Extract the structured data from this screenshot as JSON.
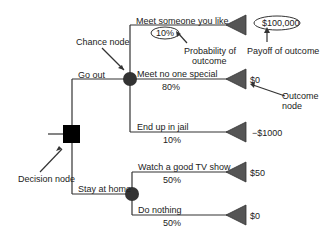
{
  "diagram": {
    "type": "decision-tree",
    "decision_node": {
      "label": "Decision node"
    },
    "branches": [
      {
        "label": "Go out",
        "chance_node_label": "Chance node",
        "outcomes": [
          {
            "label": "Meet someone you like",
            "probability": "10%",
            "payoff": "$100,000"
          },
          {
            "label": "Meet no one special",
            "probability": "80%",
            "payoff": "$0"
          },
          {
            "label": "End up in jail",
            "probability": "10%",
            "payoff": "−$1000"
          }
        ]
      },
      {
        "label": "Stay at home",
        "outcomes": [
          {
            "label": "Watch a good TV show",
            "probability": "50%",
            "payoff": "$50"
          },
          {
            "label": "Do nothing",
            "probability": "50%",
            "payoff": "$0"
          }
        ]
      }
    ],
    "annotations": {
      "probability": "Probability of",
      "probability2": "outcome",
      "payoff": "Payoff of outcome",
      "outcome_node": "Outcome",
      "outcome_node2": "node"
    },
    "colors": {
      "line": "#333333",
      "decision": "#000000",
      "chance": "#333333",
      "outcome": "#555555"
    }
  }
}
